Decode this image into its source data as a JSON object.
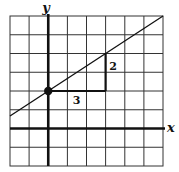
{
  "figure": {
    "type": "coordinate-grid",
    "grid": {
      "columns": 8,
      "rows": 8,
      "x_range": [
        -2,
        6
      ],
      "y_range": [
        -2,
        6
      ]
    },
    "axes": {
      "x_label": "x",
      "y_label": "y"
    },
    "line": {
      "slope": "2/3",
      "y_intercept": 2,
      "through_point": [
        0,
        2
      ]
    },
    "point": {
      "x": 0,
      "y": 2
    },
    "slope_triangle": {
      "run_label": "3",
      "rise_label": "2",
      "run": 3,
      "rise": 2
    },
    "colors": {
      "grid": "#333333",
      "axes": "#111111",
      "line": "#111111",
      "background": "#ffffff"
    }
  }
}
